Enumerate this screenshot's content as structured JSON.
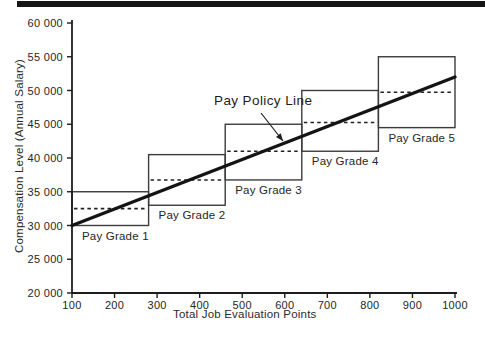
{
  "figure": {
    "top_bar_color": "#161616"
  },
  "chart_data": {
    "type": "line",
    "title": "",
    "xlabel": "Total Job Evaluation Points",
    "ylabel": "Compensation Level (Annual Salary)",
    "xlim": [
      100,
      1000
    ],
    "ylim": [
      20000,
      60000
    ],
    "grid": false,
    "legend": "none",
    "x_ticks": [
      100,
      200,
      300,
      400,
      500,
      600,
      700,
      800,
      900,
      1000
    ],
    "x_tick_labels": [
      "100",
      "200",
      "300",
      "400",
      "500",
      "600",
      "700",
      "800",
      "900",
      "1000"
    ],
    "y_ticks": [
      20000,
      25000,
      30000,
      35000,
      40000,
      45000,
      50000,
      55000,
      60000
    ],
    "y_tick_labels": [
      "20 000",
      "25 000",
      "30 000",
      "35 000",
      "40 000",
      "45 000",
      "50 000",
      "55 000",
      "60 000"
    ],
    "pay_policy_line": {
      "name": "Pay Policy Line",
      "points": [
        [
          100,
          30000
        ],
        [
          1000,
          52000
        ]
      ]
    },
    "pay_grades": [
      {
        "label": "Pay Grade 1",
        "points_min": 100,
        "points_max": 280,
        "salary_min": 30000,
        "salary_max": 35000,
        "midpoint": 32500
      },
      {
        "label": "Pay Grade 2",
        "points_min": 280,
        "points_max": 460,
        "salary_min": 33000,
        "salary_max": 40500,
        "midpoint": 36750
      },
      {
        "label": "Pay Grade 3",
        "points_min": 460,
        "points_max": 640,
        "salary_min": 36750,
        "salary_max": 45000,
        "midpoint": 41000
      },
      {
        "label": "Pay Grade 4",
        "points_min": 640,
        "points_max": 820,
        "salary_min": 41000,
        "salary_max": 50000,
        "midpoint": 45250
      },
      {
        "label": "Pay Grade 5",
        "points_min": 820,
        "points_max": 1000,
        "salary_min": 44500,
        "salary_max": 55000,
        "midpoint": 49750
      }
    ],
    "annotation": {
      "text": "Pay Policy Line",
      "arrow_from_px": [
        261,
        113
      ],
      "arrow_to_px": [
        283,
        141
      ]
    },
    "colors": {
      "axis": "#1d1d1d",
      "box_border": "#3c3c3c",
      "policy_line": "#141414",
      "dashed_line": "#222222",
      "text": "#262626"
    }
  }
}
